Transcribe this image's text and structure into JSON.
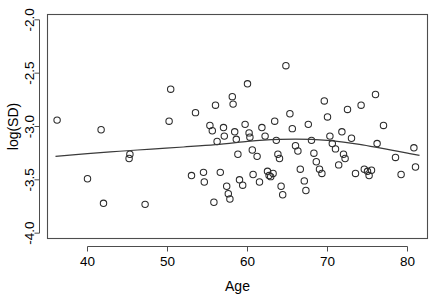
{
  "chart_data": {
    "type": "scatter",
    "title": "",
    "xlabel": "Age",
    "ylabel": "log(SD)",
    "xlim": [
      35.0,
      82.5
    ],
    "ylim": [
      -4.05,
      -1.95
    ],
    "xticks": [
      40,
      50,
      60,
      70,
      80
    ],
    "xtick_labels": [
      "40",
      "50",
      "60",
      "70",
      "80"
    ],
    "yticks": [
      -2.0,
      -2.5,
      -3.0,
      -3.5,
      -4.0
    ],
    "ytick_labels": [
      "-2.0",
      "-2.5",
      "-3.0",
      "-3.5",
      "-4.0"
    ],
    "grid": false,
    "legend": null,
    "marker": "open-circle",
    "points": [
      {
        "x": 36.2,
        "y": -2.94
      },
      {
        "x": 40.0,
        "y": -3.49
      },
      {
        "x": 41.7,
        "y": -3.03
      },
      {
        "x": 42.0,
        "y": -3.72
      },
      {
        "x": 45.2,
        "y": -3.3
      },
      {
        "x": 45.3,
        "y": -3.26
      },
      {
        "x": 47.2,
        "y": -3.73
      },
      {
        "x": 50.2,
        "y": -2.95
      },
      {
        "x": 50.4,
        "y": -2.65
      },
      {
        "x": 53.0,
        "y": -3.46
      },
      {
        "x": 53.5,
        "y": -2.87
      },
      {
        "x": 54.5,
        "y": -3.43
      },
      {
        "x": 54.6,
        "y": -3.52
      },
      {
        "x": 55.3,
        "y": -2.99
      },
      {
        "x": 55.6,
        "y": -3.04
      },
      {
        "x": 55.8,
        "y": -3.71
      },
      {
        "x": 56.0,
        "y": -2.8
      },
      {
        "x": 56.2,
        "y": -3.14
      },
      {
        "x": 56.6,
        "y": -3.43
      },
      {
        "x": 57.0,
        "y": -3.01
      },
      {
        "x": 57.1,
        "y": -3.09
      },
      {
        "x": 57.4,
        "y": -3.56
      },
      {
        "x": 57.6,
        "y": -3.63
      },
      {
        "x": 57.8,
        "y": -3.68
      },
      {
        "x": 58.1,
        "y": -2.72
      },
      {
        "x": 58.2,
        "y": -2.79
      },
      {
        "x": 58.4,
        "y": -3.05
      },
      {
        "x": 58.6,
        "y": -3.12
      },
      {
        "x": 58.8,
        "y": -3.26
      },
      {
        "x": 59.0,
        "y": -3.5
      },
      {
        "x": 59.4,
        "y": -3.55
      },
      {
        "x": 59.7,
        "y": -2.98
      },
      {
        "x": 60.0,
        "y": -2.6
      },
      {
        "x": 60.2,
        "y": -3.06
      },
      {
        "x": 60.3,
        "y": -3.1
      },
      {
        "x": 60.6,
        "y": -3.22
      },
      {
        "x": 60.7,
        "y": -3.45
      },
      {
        "x": 61.2,
        "y": -3.28
      },
      {
        "x": 61.5,
        "y": -3.52
      },
      {
        "x": 61.8,
        "y": -3.01
      },
      {
        "x": 62.2,
        "y": -3.09
      },
      {
        "x": 62.5,
        "y": -3.42
      },
      {
        "x": 62.7,
        "y": -3.46
      },
      {
        "x": 62.9,
        "y": -3.47
      },
      {
        "x": 63.2,
        "y": -3.44
      },
      {
        "x": 63.4,
        "y": -2.95
      },
      {
        "x": 63.6,
        "y": -3.13
      },
      {
        "x": 63.8,
        "y": -3.26
      },
      {
        "x": 64.0,
        "y": -3.3
      },
      {
        "x": 64.2,
        "y": -3.56
      },
      {
        "x": 64.4,
        "y": -3.64
      },
      {
        "x": 64.8,
        "y": -2.43
      },
      {
        "x": 65.3,
        "y": -2.88
      },
      {
        "x": 65.6,
        "y": -3.02
      },
      {
        "x": 66.0,
        "y": -3.18
      },
      {
        "x": 66.3,
        "y": -3.23
      },
      {
        "x": 66.6,
        "y": -3.4
      },
      {
        "x": 67.1,
        "y": -3.51
      },
      {
        "x": 67.3,
        "y": -3.6
      },
      {
        "x": 67.6,
        "y": -2.98
      },
      {
        "x": 68.0,
        "y": -3.13
      },
      {
        "x": 68.3,
        "y": -3.25
      },
      {
        "x": 68.6,
        "y": -3.33
      },
      {
        "x": 69.0,
        "y": -3.4
      },
      {
        "x": 69.3,
        "y": -3.44
      },
      {
        "x": 69.6,
        "y": -2.76
      },
      {
        "x": 70.0,
        "y": -2.91
      },
      {
        "x": 70.3,
        "y": -3.09
      },
      {
        "x": 70.6,
        "y": -3.16
      },
      {
        "x": 71.0,
        "y": -3.21
      },
      {
        "x": 71.4,
        "y": -3.36
      },
      {
        "x": 71.8,
        "y": -3.05
      },
      {
        "x": 72.0,
        "y": -3.26
      },
      {
        "x": 72.2,
        "y": -3.3
      },
      {
        "x": 72.5,
        "y": -2.84
      },
      {
        "x": 73.0,
        "y": -3.11
      },
      {
        "x": 73.5,
        "y": -3.44
      },
      {
        "x": 74.2,
        "y": -2.8
      },
      {
        "x": 74.6,
        "y": -3.4
      },
      {
        "x": 75.0,
        "y": -3.42
      },
      {
        "x": 75.2,
        "y": -3.46
      },
      {
        "x": 75.5,
        "y": -3.41
      },
      {
        "x": 76.0,
        "y": -2.7
      },
      {
        "x": 76.2,
        "y": -3.16
      },
      {
        "x": 77.0,
        "y": -2.99
      },
      {
        "x": 78.5,
        "y": -3.29
      },
      {
        "x": 79.2,
        "y": -3.45
      },
      {
        "x": 80.8,
        "y": -3.2
      },
      {
        "x": 81.0,
        "y": -3.38
      }
    ],
    "smooth_line": {
      "name": "loess-smooth",
      "x": [
        36.0,
        40.0,
        44.0,
        48.0,
        52.0,
        56.0,
        60.0,
        62.0,
        64.0,
        66.0,
        68.0,
        70.0,
        72.0,
        74.0,
        76.0,
        78.0,
        80.0,
        81.5
      ],
      "y": [
        -3.281,
        -3.255,
        -3.232,
        -3.212,
        -3.192,
        -3.17,
        -3.14,
        -3.128,
        -3.121,
        -3.118,
        -3.121,
        -3.13,
        -3.146,
        -3.168,
        -3.194,
        -3.222,
        -3.25,
        -3.27
      ]
    }
  },
  "colors": {
    "background": "#ffffff",
    "axis": "#4d4d4d",
    "marker": "#2b2b2b",
    "curve": "#3a3a3a"
  }
}
